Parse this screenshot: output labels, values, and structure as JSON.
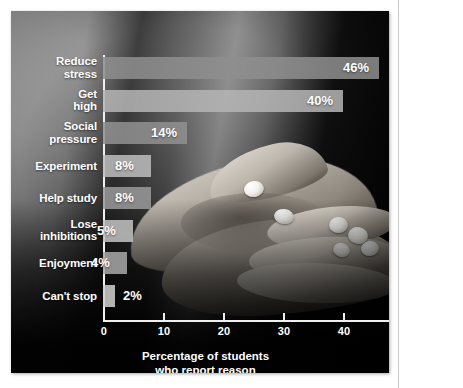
{
  "chart_data": {
    "type": "bar",
    "orientation": "horizontal",
    "title": "",
    "xlabel": "Percentage of students who report reason",
    "ylabel": "",
    "xlim": [
      0,
      50
    ],
    "xticks": [
      0,
      10,
      20,
      30,
      40,
      50
    ],
    "xtick_labels": [
      "0",
      "10",
      "20",
      "30",
      "40",
      "50"
    ],
    "grid": false,
    "legend": null,
    "categories": [
      "Reduce stress",
      "Get high",
      "Social pressure",
      "Experiment",
      "Help study",
      "Lose inhibitions",
      "Enjoyment",
      "Can't stop"
    ],
    "values": [
      46,
      40,
      14,
      8,
      8,
      5,
      4,
      2
    ],
    "data_labels": [
      "46%",
      "40%",
      "14%",
      "8%",
      "8%",
      "5%",
      "4%",
      "2%"
    ],
    "bars": [
      {
        "label_line1": "Reduce",
        "label_line2": "stress",
        "value": 46,
        "data_label": "46%",
        "fill": "#8e8e8e",
        "label_inside": true
      },
      {
        "label_line1": "Get",
        "label_line2": "high",
        "value": 40,
        "data_label": "40%",
        "fill": "#b5b5b5",
        "label_inside": true
      },
      {
        "label_line1": "Social",
        "label_line2": "pressure",
        "value": 14,
        "data_label": "14%",
        "fill": "#909090",
        "label_inside": true
      },
      {
        "label_line1": "Experiment",
        "label_line2": "",
        "value": 8,
        "data_label": "8%",
        "fill": "#bdbdbd",
        "label_inside": true
      },
      {
        "label_line1": "Help study",
        "label_line2": "",
        "value": 8,
        "data_label": "8%",
        "fill": "#9a9a9a",
        "label_inside": true
      },
      {
        "label_line1": "Lose",
        "label_line2": "inhibitions",
        "value": 5,
        "data_label": "5%",
        "fill": "#c2c2c2",
        "label_inside": true
      },
      {
        "label_line1": "Enjoyment",
        "label_line2": "",
        "value": 4,
        "data_label": "4%",
        "fill": "#a8a8a8",
        "label_inside": true
      },
      {
        "label_line1": "Can't stop",
        "label_line2": "",
        "value": 2,
        "data_label": "2%",
        "fill": "#cfcfcf",
        "label_inside": false
      }
    ],
    "axis_title_line1": "Percentage of students",
    "axis_title_line2": "who report reason",
    "colors": {
      "axis": "#f0f0f0",
      "text": "#ffffff",
      "photo_background": "#0a0a0a",
      "page_background": "#ffffff",
      "rule": "#c9c9c9"
    }
  }
}
